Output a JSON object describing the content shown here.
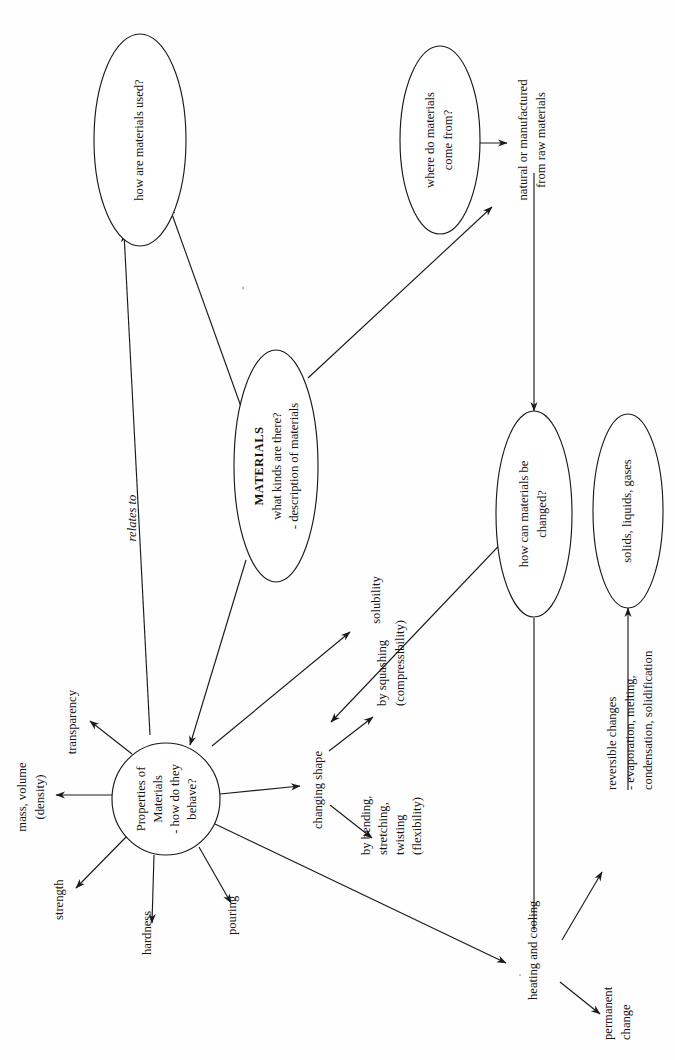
{
  "diagram": {
    "orientation": "rotated-90-ccw",
    "ink_color": "#1a1a1a",
    "background_color": "#fefefe",
    "nodes": {
      "materials": {
        "title": "MATERIALS",
        "line2": "what kinds are there?",
        "line3": "- description of materials"
      },
      "used": {
        "line1": "how are materials used?"
      },
      "origin": {
        "line1": "where do materials",
        "line2": "come from?"
      },
      "changed": {
        "line1": "how can materials be",
        "line2": "changed?"
      },
      "states": {
        "line1": "solids, liquids, gases"
      },
      "properties": {
        "line1": "Properties of",
        "line2": "Materials",
        "line3": "- how do they",
        "line4": "behave?"
      }
    },
    "labels": {
      "raw": {
        "line1": "natural or manufactured",
        "line2": "from raw materials"
      },
      "relates_to": "relates to",
      "transparency": "transparency",
      "mass_volume": {
        "line1": "mass, volume",
        "line2": "(density)"
      },
      "strength": "strength",
      "hardness": "hardness",
      "pouring": "pouring",
      "changing_shape": "changing shape",
      "squashing": {
        "line1": "by squashing",
        "line2": "(compressibility)"
      },
      "bending": {
        "line1": "by bending,",
        "line2": "stretching,",
        "line3": "twisting",
        "line4": "(flexibility)"
      },
      "solubility": "solubility",
      "heating_cooling": "heating and cooling",
      "reversible": {
        "line1": "reversible changes",
        "line2": "- evaporation, melting,",
        "line3": "condensation, solidification"
      },
      "permanent": {
        "line1": "permanent",
        "line2": "change"
      }
    }
  }
}
